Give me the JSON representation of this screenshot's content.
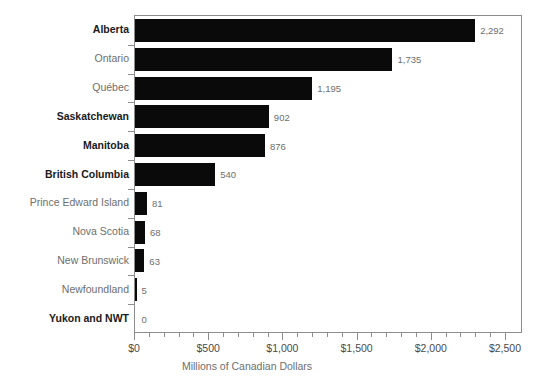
{
  "chart_data": {
    "type": "bar",
    "orientation": "horizontal",
    "title": "",
    "subtitle": "",
    "xlabel": "Millions of Canadian Dollars",
    "ylabel": "",
    "xlim": [
      0,
      2500
    ],
    "xticks": [
      0,
      500,
      1000,
      1500,
      2000,
      2500
    ],
    "xtick_labels": [
      "$0",
      "$500",
      "$1,000",
      "$1,500",
      "$2,000",
      "$2,500"
    ],
    "minor_tick_interval": 100,
    "grid": false,
    "legend": false,
    "bar_color": "#0a0a0a",
    "categories": [
      "Alberta",
      "Ontario",
      "Québec",
      "Saskatchewan",
      "Manitoba",
      "British Columbia",
      "Prince Edward Island",
      "Nova Scotia",
      "New Brunswick",
      "Newfoundland",
      "Yukon and NWT"
    ],
    "values": [
      2292,
      1735,
      1195,
      902,
      876,
      540,
      81,
      68,
      63,
      5,
      0
    ],
    "value_labels": [
      "2,292",
      "1,735",
      "1,195",
      "902",
      "876",
      "540",
      "81",
      "68",
      "63",
      "5",
      "0"
    ],
    "category_emphasis": [
      true,
      false,
      false,
      true,
      true,
      true,
      false,
      false,
      false,
      false,
      true
    ]
  },
  "colors": {
    "bar": "#0a0a0a",
    "axis": "#8d8d8d",
    "label_regular": "#6e6e6e",
    "label_bold": "#1a1a1a",
    "value_label": "#6e6e6e",
    "tick_label": "#4a4a4a",
    "background": "#ffffff"
  }
}
